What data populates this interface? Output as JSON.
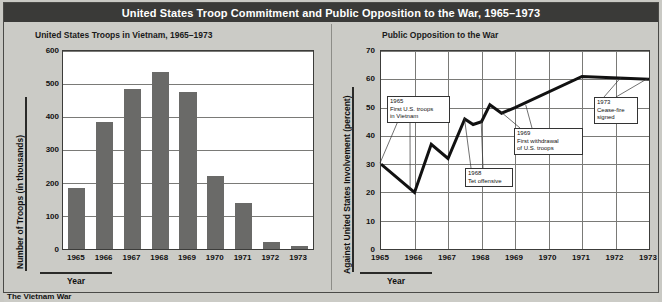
{
  "header": {
    "title": "United States Troop Commitment and Public Opposition to the War, 1965–1973"
  },
  "colors": {
    "title_bar_bg": "#3a3a38",
    "title_text": "#ffffff",
    "page_bg": "#c9c9c4",
    "plot_bg": "#ffffff",
    "bar_fill": "#6a6a68",
    "line_stroke": "#111111",
    "grid": "#7a7a77",
    "frame": "#3c3c3a"
  },
  "caption": {
    "text": "The Vietnam War"
  },
  "left_panel": {
    "subtitle": "United States Troops in Vietnam, 1965–1973",
    "x_axis_title": "Year",
    "y_axis_title": "Number of Troops (in thousands)"
  },
  "right_panel": {
    "subtitle": "Public Opposition to the War",
    "x_axis_title": "Year",
    "y_axis_title": "Against United States Involvement (percent)"
  },
  "chart_data": [
    {
      "type": "bar",
      "title": "United States Troops in Vietnam, 1965–1973",
      "xlabel": "Year",
      "ylabel": "Number of Troops (in thousands)",
      "categories": [
        "1965",
        "1966",
        "1967",
        "1968",
        "1969",
        "1970",
        "1971",
        "1972",
        "1973"
      ],
      "values": [
        184,
        385,
        486,
        536,
        475,
        220,
        140,
        22,
        8
      ],
      "ylim": [
        0,
        600
      ],
      "yticks": [
        0,
        100,
        200,
        300,
        400,
        500,
        600
      ],
      "grid": true,
      "legend": "none"
    },
    {
      "type": "line",
      "title": "Public Opposition to the War",
      "xlabel": "Year",
      "ylabel": "Against United States Involvement (percent)",
      "ylim": [
        0,
        70
      ],
      "yticks": [
        0,
        10,
        20,
        30,
        40,
        50,
        60,
        70
      ],
      "xticks": [
        "1965",
        "1966",
        "1967",
        "1968",
        "1969",
        "1970",
        "1971",
        "1972",
        "1973"
      ],
      "grid": true,
      "legend": "none",
      "x": [
        1965.0,
        1966.0,
        1966.5,
        1967.0,
        1967.5,
        1967.75,
        1968.0,
        1968.25,
        1968.6,
        1969.0,
        1971.0,
        1973.0
      ],
      "values": [
        30,
        20,
        37,
        32,
        46,
        44,
        45,
        51,
        48,
        50,
        61,
        60
      ],
      "annotations": [
        {
          "id": "1965-first-troops",
          "year": "1965",
          "lines": [
            "First U.S. troops",
            "in Vietnam"
          ]
        },
        {
          "id": "1968-tet-offensive",
          "year": "1968",
          "lines": [
            "Tet offensive"
          ]
        },
        {
          "id": "1969-first-withdrawal",
          "year": "1969",
          "lines": [
            "First withdrawal",
            "of U.S. troops"
          ]
        },
        {
          "id": "1973-cease-fire",
          "year": "1973",
          "lines": [
            "Cease-fire",
            "signed"
          ]
        }
      ]
    }
  ]
}
